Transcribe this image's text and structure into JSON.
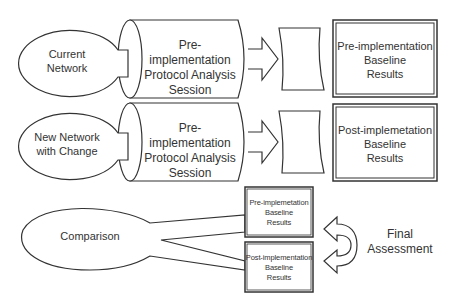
{
  "diagram": {
    "rows": [
      {
        "source": "Current\nNetwork",
        "session": "Pre-implementation\nProtocol Analysis\nSession",
        "result": "Pre-implementation\nBaseline\nResults"
      },
      {
        "source": "New Network\nwith Change",
        "session": "Pre-implementation\nProtocol Analysis\nSession",
        "result": "Post-implemetation\nBaseline\nResults"
      }
    ],
    "comparison": {
      "label": "Comparison",
      "top_result": "Pre-implemetation\nBaseline\nResults",
      "bottom_result": "Post-implementation\nBaseline\nResults"
    },
    "final": {
      "label": "Final\nAssessment"
    }
  },
  "colors": {
    "stroke": "#333333",
    "fill": "#ffffff",
    "text": "#333333"
  }
}
